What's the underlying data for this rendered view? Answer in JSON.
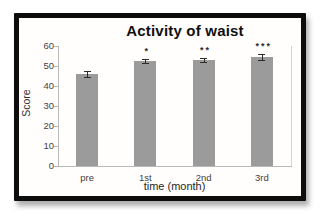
{
  "figure": {
    "frame_color": "#0d0d0d",
    "background": "#ffffff"
  },
  "chart_data": {
    "type": "bar",
    "title": "Activity of waist",
    "xlabel": "time (month)",
    "ylabel": "Score",
    "categories": [
      "pre",
      "1st",
      "2nd",
      "3rd"
    ],
    "values": [
      46,
      52.5,
      53,
      54.5
    ],
    "errors": [
      1.5,
      1.2,
      1.2,
      1.5
    ],
    "significance": [
      "",
      "*",
      "**",
      "***"
    ],
    "ylim": [
      0,
      60
    ],
    "yticks": [
      0,
      10,
      20,
      30,
      40,
      50,
      60
    ],
    "grid": false,
    "legend": "none",
    "bar_color": "#9b9b9b",
    "axis_color": "#b8b8b8",
    "error_bar_color": "#2b2b2b",
    "tick_label_color": "#3f3f3f",
    "title_color": "#101010"
  }
}
